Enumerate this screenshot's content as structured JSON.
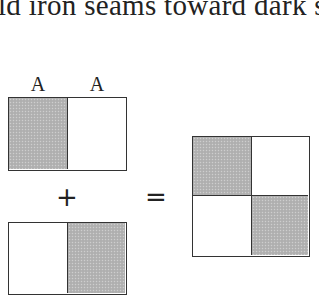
{
  "text": {
    "top_line": "ld iron seams toward dark s"
  },
  "figure": {
    "column_labels": [
      "A",
      "A"
    ],
    "plus_symbol": "+",
    "equals_symbol": "=",
    "top_rectangle": {
      "cells": [
        {
          "position": "left",
          "shaded": true
        },
        {
          "position": "right",
          "shaded": false
        }
      ]
    },
    "bottom_rectangle": {
      "cells": [
        {
          "position": "left",
          "shaded": false
        },
        {
          "position": "right",
          "shaded": true
        }
      ]
    },
    "result_square": {
      "cells": [
        {
          "position": "top-left",
          "shaded": true
        },
        {
          "position": "top-right",
          "shaded": false
        },
        {
          "position": "bottom-left",
          "shaded": false
        },
        {
          "position": "bottom-right",
          "shaded": true
        }
      ]
    },
    "colors": {
      "shade": "#b4b4b4",
      "stroke": "#333333",
      "background": "#ffffff"
    }
  }
}
